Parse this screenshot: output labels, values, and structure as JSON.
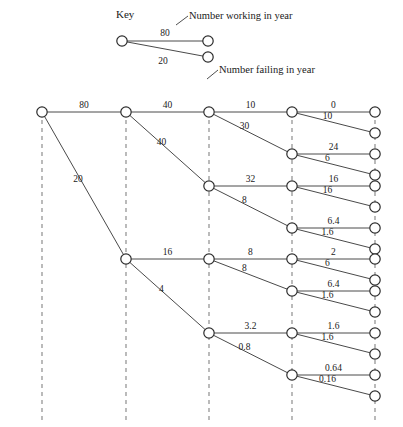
{
  "key": {
    "title": "Key",
    "working_caption": "Number working in year",
    "failing_caption": "Number failing in year",
    "working_value": "80",
    "failing_value": "20"
  },
  "chart_data": {
    "type": "diagram",
    "title": "Key",
    "columns": 5,
    "column_x": [
      42,
      126,
      209,
      292,
      375
    ],
    "root_value": 100,
    "nodes": [
      {
        "id": "n0",
        "col": 0,
        "y": 112
      },
      {
        "id": "n1a",
        "col": 1,
        "y": 112
      },
      {
        "id": "n1b",
        "col": 1,
        "y": 259
      },
      {
        "id": "n2a",
        "col": 2,
        "y": 112
      },
      {
        "id": "n2b",
        "col": 2,
        "y": 186
      },
      {
        "id": "n2c",
        "col": 2,
        "y": 259
      },
      {
        "id": "n2d",
        "col": 2,
        "y": 333
      },
      {
        "id": "n3a",
        "col": 3,
        "y": 112
      },
      {
        "id": "n3b",
        "col": 3,
        "y": 154
      },
      {
        "id": "n3c",
        "col": 3,
        "y": 186
      },
      {
        "id": "n3d",
        "col": 3,
        "y": 228
      },
      {
        "id": "n3e",
        "col": 3,
        "y": 259
      },
      {
        "id": "n3f",
        "col": 3,
        "y": 291
      },
      {
        "id": "n3g",
        "col": 3,
        "y": 333
      },
      {
        "id": "n3h",
        "col": 3,
        "y": 375
      },
      {
        "id": "n4a",
        "col": 4,
        "y": 112
      },
      {
        "id": "n4b",
        "col": 4,
        "y": 133
      },
      {
        "id": "n4c",
        "col": 4,
        "y": 154
      },
      {
        "id": "n4d",
        "col": 4,
        "y": 175
      },
      {
        "id": "n4e",
        "col": 4,
        "y": 186
      },
      {
        "id": "n4f",
        "col": 4,
        "y": 207
      },
      {
        "id": "n4g",
        "col": 4,
        "y": 228
      },
      {
        "id": "n4h",
        "col": 4,
        "y": 249
      },
      {
        "id": "n4i",
        "col": 4,
        "y": 259
      },
      {
        "id": "n4j",
        "col": 4,
        "y": 280
      },
      {
        "id": "n4k",
        "col": 4,
        "y": 291
      },
      {
        "id": "n4l",
        "col": 4,
        "y": 312
      },
      {
        "id": "n4m",
        "col": 4,
        "y": 333
      },
      {
        "id": "n4n",
        "col": 4,
        "y": 354
      },
      {
        "id": "n4o",
        "col": 4,
        "y": 375
      },
      {
        "id": "n4p",
        "col": 4,
        "y": 396
      }
    ],
    "edges": [
      {
        "from": "n0",
        "to": "n1a",
        "label": "80",
        "kind": "working"
      },
      {
        "from": "n0",
        "to": "n1b",
        "label": "20",
        "kind": "failing"
      },
      {
        "from": "n1a",
        "to": "n2a",
        "label": "40",
        "kind": "working"
      },
      {
        "from": "n1a",
        "to": "n2b",
        "label": "40",
        "kind": "failing"
      },
      {
        "from": "n1b",
        "to": "n2c",
        "label": "16",
        "kind": "working"
      },
      {
        "from": "n1b",
        "to": "n2d",
        "label": "4",
        "kind": "failing"
      },
      {
        "from": "n2a",
        "to": "n3a",
        "label": "10",
        "kind": "working"
      },
      {
        "from": "n2a",
        "to": "n3b",
        "label": "30",
        "kind": "failing"
      },
      {
        "from": "n2b",
        "to": "n3c",
        "label": "32",
        "kind": "working"
      },
      {
        "from": "n2b",
        "to": "n3d",
        "label": "8",
        "kind": "failing"
      },
      {
        "from": "n2c",
        "to": "n3e",
        "label": "8",
        "kind": "working"
      },
      {
        "from": "n2c",
        "to": "n3f",
        "label": "8",
        "kind": "failing"
      },
      {
        "from": "n2d",
        "to": "n3g",
        "label": "3.2",
        "kind": "working"
      },
      {
        "from": "n2d",
        "to": "n3h",
        "label": "0.8",
        "kind": "failing"
      },
      {
        "from": "n3a",
        "to": "n4a",
        "label": "0",
        "kind": "working"
      },
      {
        "from": "n3a",
        "to": "n4b",
        "label": "10",
        "kind": "failing"
      },
      {
        "from": "n3b",
        "to": "n4c",
        "label": "24",
        "kind": "working"
      },
      {
        "from": "n3b",
        "to": "n4d",
        "label": "6",
        "kind": "failing"
      },
      {
        "from": "n3c",
        "to": "n4e",
        "label": "16",
        "kind": "working"
      },
      {
        "from": "n3c",
        "to": "n4f",
        "label": "16",
        "kind": "failing"
      },
      {
        "from": "n3d",
        "to": "n4g",
        "label": "6.4",
        "kind": "working"
      },
      {
        "from": "n3d",
        "to": "n4h",
        "label": "1.6",
        "kind": "failing"
      },
      {
        "from": "n3e",
        "to": "n4i",
        "label": "2",
        "kind": "working"
      },
      {
        "from": "n3e",
        "to": "n4j",
        "label": "6",
        "kind": "failing"
      },
      {
        "from": "n3f",
        "to": "n4k",
        "label": "6.4",
        "kind": "working"
      },
      {
        "from": "n3f",
        "to": "n4l",
        "label": "1.6",
        "kind": "failing"
      },
      {
        "from": "n3g",
        "to": "n4m",
        "label": "1.6",
        "kind": "working"
      },
      {
        "from": "n3g",
        "to": "n4n",
        "label": "1.6",
        "kind": "failing"
      },
      {
        "from": "n3h",
        "to": "n4o",
        "label": "0.64",
        "kind": "working"
      },
      {
        "from": "n3h",
        "to": "n4p",
        "label": "0.16",
        "kind": "failing"
      }
    ],
    "colors": {
      "edge": "#4a4a4a",
      "guide": "#8e8e8e",
      "node_stroke": "#2b2b2b",
      "node_fill": "#ffffff",
      "text": "#1a1a1a",
      "background": "#ffffff"
    }
  }
}
